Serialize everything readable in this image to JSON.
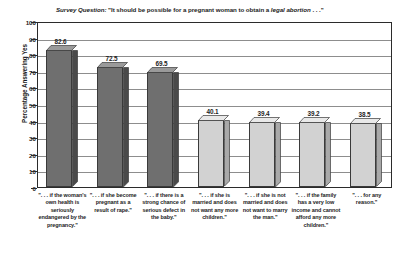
{
  "chart_data": {
    "type": "bar",
    "title": "Survey Question: \"It should be possible for a pregnant woman to obtain a legal abortion . . .\"",
    "title_parts": {
      "lead_italic": "Survey Question:",
      "plain_1": " \"It should be possible for a pregnant woman to obtain a ",
      "emphasis_italic": "legal abortion",
      "plain_2": " . . .\""
    },
    "xlabel": "",
    "ylabel": "Percentage Answering Yes",
    "ylim": [
      0,
      100
    ],
    "ytick_step": 10,
    "yticks": [
      "100",
      "90",
      "80",
      "70",
      "60",
      "50",
      "40",
      "30",
      "20",
      "10",
      "0"
    ],
    "grid": true,
    "legend": "none",
    "categories": [
      ". . . if the woman's own health is seriously endangered by the pregnancy.",
      ". . . if she become pregnant as a result of rape.",
      ". . . if there is a strong chance of serious defect in the baby.",
      ". . . if she is married and does not want any more children.",
      ". . . if she is not married and does not want to marry the man.",
      ". . . if the family has a very low income and cannot afford any more children.",
      ". . . for any reason."
    ],
    "category_labels": [
      "\". . . if the woman's own health is seriously endangered by the pregnancy.\"",
      "\". . . if she become pregnant as a result of rape.\"",
      "\". . . if there is a strong chance of serious defect in the baby.\"",
      "\". . . if she is married and does not want any more children.\"",
      "\". . . if she is not married and does not want to marry the man.\"",
      "\". . . if the family has a very low income and cannot afford any more children.\"",
      "\". . . for any reason.\""
    ],
    "values": [
      82.6,
      72.5,
      69.5,
      40.1,
      39.4,
      39.2,
      38.5
    ],
    "value_labels": [
      "82.6",
      "72.5",
      "69.5",
      "40.1",
      "39.4",
      "39.2",
      "38.5"
    ],
    "bar_colors": [
      "#6f6f6f",
      "#6f6f6f",
      "#6f6f6f",
      "#d2d2d2",
      "#d2d2d2",
      "#d2d2d2",
      "#d2d2d2"
    ],
    "bar_top_colors": [
      "#9a9a9a",
      "#9a9a9a",
      "#9a9a9a",
      "#e9e9e9",
      "#e9e9e9",
      "#e9e9e9",
      "#e9e9e9"
    ],
    "bar_side_colors": [
      "#4a4a4a",
      "#4a4a4a",
      "#4a4a4a",
      "#a9a9a9",
      "#a9a9a9",
      "#a9a9a9",
      "#a9a9a9"
    ],
    "axis_color": "#2b2b2b",
    "gridline_color": "#8d8d8d",
    "text_color": "#1c1c1c",
    "plot_background": "#ffffff"
  }
}
